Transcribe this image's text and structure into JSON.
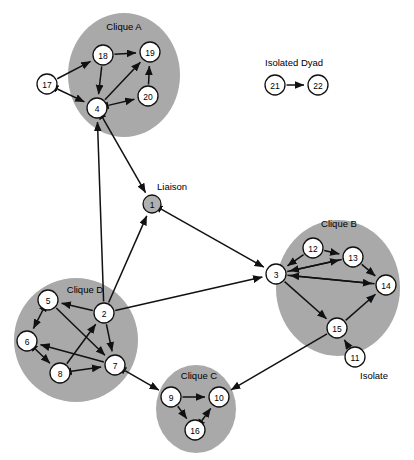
{
  "figure": {
    "type": "network-diagram",
    "width": 414,
    "height": 460,
    "background_color": "#ffffff",
    "blob_color": "#a9a9a9",
    "node_fill_color": "#b0b0b0",
    "node_open_color": "#ffffff",
    "edge_color": "#111111"
  },
  "group_labels": [
    {
      "id": "clique-a",
      "text": "Clique A",
      "x": 124,
      "y": 30
    },
    {
      "id": "clique-b",
      "text": "Clique B",
      "x": 339,
      "y": 227
    },
    {
      "id": "clique-c",
      "text": "Clique C",
      "x": 199,
      "y": 379
    },
    {
      "id": "clique-d",
      "text": "Clique D",
      "x": 85,
      "y": 293
    }
  ],
  "annotations": [
    {
      "id": "isolated-dyad",
      "text": "Isolated Dyad",
      "x": 265,
      "y": 66
    },
    {
      "id": "liaison",
      "text": "Liaison",
      "x": 157,
      "y": 190
    },
    {
      "id": "isolate",
      "text": "Isolate",
      "x": 360,
      "y": 379
    }
  ],
  "blobs": [
    {
      "id": "blob-clique-a",
      "cx": 124,
      "cy": 75,
      "rx": 56,
      "ry": 62
    },
    {
      "id": "blob-clique-b",
      "cx": 338,
      "cy": 288,
      "rx": 62,
      "ry": 68
    },
    {
      "id": "blob-clique-c",
      "cx": 196,
      "cy": 409,
      "rx": 40,
      "ry": 44
    },
    {
      "id": "blob-clique-d",
      "cx": 76,
      "cy": 340,
      "rx": 62,
      "ry": 62
    }
  ],
  "nodes": [
    {
      "id": "1",
      "label": "1",
      "x": 152,
      "y": 204,
      "r": 9,
      "fill": "filled",
      "group": "liaison"
    },
    {
      "id": "2",
      "label": "2",
      "x": 104,
      "y": 313,
      "r": 10,
      "fill": "open",
      "group": "clique-d"
    },
    {
      "id": "3",
      "label": "3",
      "x": 276,
      "y": 274,
      "r": 10,
      "fill": "open",
      "group": "clique-b"
    },
    {
      "id": "4",
      "label": "4",
      "x": 97,
      "y": 108,
      "r": 10,
      "fill": "open",
      "group": "clique-a"
    },
    {
      "id": "5",
      "label": "5",
      "x": 48,
      "y": 300,
      "r": 10,
      "fill": "open",
      "group": "clique-d"
    },
    {
      "id": "6",
      "label": "6",
      "x": 27,
      "y": 341,
      "r": 10,
      "fill": "open",
      "group": "clique-d"
    },
    {
      "id": "7",
      "label": "7",
      "x": 115,
      "y": 365,
      "r": 10,
      "fill": "open",
      "group": "clique-d"
    },
    {
      "id": "8",
      "label": "8",
      "x": 60,
      "y": 373,
      "r": 10,
      "fill": "open",
      "group": "clique-d"
    },
    {
      "id": "9",
      "label": "9",
      "x": 171,
      "y": 397,
      "r": 10,
      "fill": "open",
      "group": "clique-c"
    },
    {
      "id": "10",
      "label": "10",
      "x": 219,
      "y": 397,
      "r": 10,
      "fill": "open",
      "group": "clique-c"
    },
    {
      "id": "11",
      "label": "11",
      "x": 355,
      "y": 357,
      "r": 10,
      "fill": "open",
      "group": "isolate"
    },
    {
      "id": "12",
      "label": "12",
      "x": 313,
      "y": 248,
      "r": 10,
      "fill": "open",
      "group": "clique-b"
    },
    {
      "id": "13",
      "label": "13",
      "x": 353,
      "y": 257,
      "r": 10,
      "fill": "open",
      "group": "clique-b"
    },
    {
      "id": "14",
      "label": "14",
      "x": 386,
      "y": 285,
      "r": 10,
      "fill": "open",
      "group": "clique-b"
    },
    {
      "id": "15",
      "label": "15",
      "x": 337,
      "y": 328,
      "r": 10,
      "fill": "open",
      "group": "clique-b"
    },
    {
      "id": "16",
      "label": "16",
      "x": 195,
      "y": 430,
      "r": 10,
      "fill": "open",
      "group": "clique-c"
    },
    {
      "id": "17",
      "label": "17",
      "x": 47,
      "y": 84,
      "r": 10,
      "fill": "open",
      "group": "clique-a"
    },
    {
      "id": "18",
      "label": "18",
      "x": 103,
      "y": 55,
      "r": 10,
      "fill": "open",
      "group": "clique-a"
    },
    {
      "id": "19",
      "label": "19",
      "x": 150,
      "y": 52,
      "r": 10,
      "fill": "open",
      "group": "clique-a"
    },
    {
      "id": "20",
      "label": "20",
      "x": 148,
      "y": 96,
      "r": 10,
      "fill": "open",
      "group": "clique-a"
    },
    {
      "id": "21",
      "label": "21",
      "x": 275,
      "y": 85,
      "r": 10,
      "fill": "open",
      "group": "isolated-dyad"
    },
    {
      "id": "22",
      "label": "22",
      "x": 318,
      "y": 85,
      "r": 10,
      "fill": "open",
      "group": "isolated-dyad"
    }
  ],
  "edges": [
    {
      "from": "18",
      "to": "19",
      "direction": "one-way"
    },
    {
      "from": "17",
      "to": "18",
      "direction": "one-way"
    },
    {
      "from": "18",
      "to": "4",
      "direction": "one-way"
    },
    {
      "from": "4",
      "to": "19",
      "direction": "one-way"
    },
    {
      "from": "20",
      "to": "19",
      "direction": "one-way"
    },
    {
      "from": "4",
      "to": "20",
      "direction": "two-way"
    },
    {
      "from": "17",
      "to": "4",
      "direction": "two-way"
    },
    {
      "from": "4",
      "to": "1",
      "direction": "two-way"
    },
    {
      "from": "2",
      "to": "4",
      "direction": "one-way"
    },
    {
      "from": "2",
      "to": "1",
      "direction": "one-way"
    },
    {
      "from": "1",
      "to": "3",
      "direction": "two-way"
    },
    {
      "from": "2",
      "to": "3",
      "direction": "one-way"
    },
    {
      "from": "2",
      "to": "5",
      "direction": "one-way"
    },
    {
      "from": "5",
      "to": "6",
      "direction": "two-way"
    },
    {
      "from": "5",
      "to": "7",
      "direction": "one-way"
    },
    {
      "from": "2",
      "to": "7",
      "direction": "one-way"
    },
    {
      "from": "8",
      "to": "2",
      "direction": "one-way"
    },
    {
      "from": "6",
      "to": "8",
      "direction": "two-way"
    },
    {
      "from": "8",
      "to": "7",
      "direction": "two-way"
    },
    {
      "from": "7",
      "to": "6",
      "direction": "one-way"
    },
    {
      "from": "7",
      "to": "9",
      "direction": "two-way"
    },
    {
      "from": "9",
      "to": "10",
      "direction": "one-way"
    },
    {
      "from": "9",
      "to": "16",
      "direction": "one-way"
    },
    {
      "from": "16",
      "to": "10",
      "direction": "two-way"
    },
    {
      "from": "15",
      "to": "10",
      "direction": "one-way"
    },
    {
      "from": "12",
      "to": "13",
      "direction": "one-way"
    },
    {
      "from": "12",
      "to": "3",
      "direction": "one-way"
    },
    {
      "from": "13",
      "to": "3",
      "direction": "one-way"
    },
    {
      "from": "3",
      "to": "13",
      "direction": "one-way"
    },
    {
      "from": "3",
      "to": "14",
      "direction": "one-way"
    },
    {
      "from": "14",
      "to": "3",
      "direction": "one-way"
    },
    {
      "from": "13",
      "to": "14",
      "direction": "one-way"
    },
    {
      "from": "3",
      "to": "15",
      "direction": "one-way"
    },
    {
      "from": "15",
      "to": "14",
      "direction": "one-way"
    },
    {
      "from": "11",
      "to": "15",
      "direction": "one-way"
    },
    {
      "from": "21",
      "to": "22",
      "direction": "one-way"
    }
  ]
}
